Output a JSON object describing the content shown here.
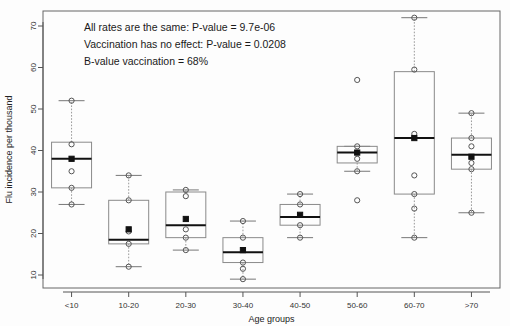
{
  "chart_data": {
    "type": "box",
    "title": "",
    "xlabel": "Age groups",
    "ylabel": "Flu incidence per thousand",
    "categories": [
      "<10",
      "10-20",
      "20-30",
      "30-40",
      "40-50",
      "50-60",
      "60-70",
      ">70"
    ],
    "ylim": [
      7,
      74
    ],
    "yticks": [
      10,
      20,
      30,
      40,
      50,
      60,
      70
    ],
    "ytick_labels": [
      "10",
      "20",
      "30",
      "40",
      "50",
      "60",
      "70"
    ],
    "grid": false,
    "legend": "none",
    "boxes": [
      {
        "category": "<10",
        "whisker_low": 27.0,
        "q1": 31.0,
        "median": 38.0,
        "q3": 42.0,
        "whisker_high": 52.0,
        "points_open": [
          52.0,
          41.5,
          35.0,
          31.0,
          27.0
        ],
        "points_filled": [
          38.0
        ],
        "outliers": []
      },
      {
        "category": "10-20",
        "whisker_low": 12.0,
        "q1": 17.5,
        "median": 18.5,
        "q3": 28.0,
        "whisker_high": 34.0,
        "points_open": [
          34.0,
          28.0,
          20.5,
          17.5,
          12.0
        ],
        "points_filled": [
          21.0
        ],
        "outliers": []
      },
      {
        "category": "20-30",
        "whisker_low": 16.0,
        "q1": 19.0,
        "median": 22.0,
        "q3": 30.0,
        "whisker_high": 30.5,
        "points_open": [
          30.5,
          29.0,
          21.0,
          19.0,
          16.0
        ],
        "points_filled": [
          23.5
        ],
        "outliers": []
      },
      {
        "category": "30-40",
        "whisker_low": 9.0,
        "q1": 13.0,
        "median": 15.5,
        "q3": 19.0,
        "whisker_high": 23.0,
        "points_open": [
          23.0,
          19.0,
          13.0,
          11.5,
          9.0
        ],
        "points_filled": [
          16.0
        ],
        "outliers": []
      },
      {
        "category": "40-50",
        "whisker_low": 19.0,
        "q1": 22.0,
        "median": 24.0,
        "q3": 27.0,
        "whisker_high": 29.5,
        "points_open": [
          29.5,
          27.0,
          22.0,
          19.0
        ],
        "points_filled": [
          24.5
        ],
        "outliers": []
      },
      {
        "category": "50-60",
        "whisker_low": 35.0,
        "q1": 37.0,
        "median": 39.5,
        "q3": 41.0,
        "whisker_high": 41.0,
        "points_open": [
          41.0,
          38.0,
          35.0
        ],
        "points_filled": [
          39.5
        ],
        "outliers": [
          57.0,
          28.0
        ]
      },
      {
        "category": "60-70",
        "whisker_low": 19.0,
        "q1": 29.5,
        "median": 43.0,
        "q3": 59.0,
        "whisker_high": 72.0,
        "points_open": [
          72.0,
          59.5,
          44.0,
          34.0,
          29.5,
          26.0,
          19.0
        ],
        "points_filled": [
          43.0
        ],
        "outliers": []
      },
      {
        "category": ">70",
        "whisker_low": 25.0,
        "q1": 35.5,
        "median": 39.0,
        "q3": 43.0,
        "whisker_high": 49.0,
        "points_open": [
          49.0,
          43.0,
          41.0,
          37.0,
          35.5,
          25.0
        ],
        "points_filled": [
          38.5
        ],
        "outliers": []
      }
    ],
    "annotations": [
      "All rates are the same: P-value = 9.7e-06",
      "Vaccination has no effect: P-value = 0.0208",
      "B-value vaccination = 68%"
    ]
  }
}
